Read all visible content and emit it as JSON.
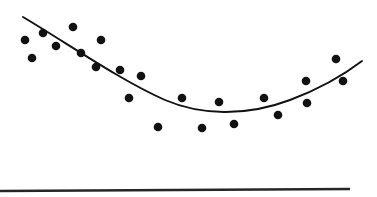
{
  "figure": {
    "width": 377,
    "height": 197,
    "background": "#ffffff",
    "title": "",
    "caption": ""
  },
  "style": {
    "point_color": "#111111",
    "point_radius": 4.3,
    "curve_color": "#111111",
    "curve_width": 1.9,
    "axis_color": "#262626",
    "axis_width": 2.4
  },
  "axis_line": {
    "name": "baseline-axis",
    "x1": 0,
    "y1": 191,
    "x2": 350,
    "y2": 189
  },
  "chart_data": {
    "type": "scatter",
    "title": "",
    "subtitle": "",
    "xlabel": "",
    "ylabel": "",
    "xlim": [
      0,
      377
    ],
    "ylim": [
      0,
      197
    ],
    "grid": false,
    "legend": null,
    "annotations": [],
    "tick_labels": {
      "x": [],
      "y": []
    },
    "series": [
      {
        "name": "observations",
        "type": "scatter",
        "marker": "filled-circle",
        "color": "#111111",
        "points": [
          {
            "x": 25,
            "y": 40
          },
          {
            "x": 32,
            "y": 58
          },
          {
            "x": 43,
            "y": 33
          },
          {
            "x": 56,
            "y": 46
          },
          {
            "x": 73,
            "y": 27
          },
          {
            "x": 81,
            "y": 53
          },
          {
            "x": 96,
            "y": 67
          },
          {
            "x": 101,
            "y": 40
          },
          {
            "x": 120,
            "y": 70
          },
          {
            "x": 129,
            "y": 98
          },
          {
            "x": 141,
            "y": 76
          },
          {
            "x": 158,
            "y": 127
          },
          {
            "x": 182,
            "y": 98
          },
          {
            "x": 202,
            "y": 128
          },
          {
            "x": 219,
            "y": 102
          },
          {
            "x": 234,
            "y": 124
          },
          {
            "x": 264,
            "y": 98
          },
          {
            "x": 278,
            "y": 115
          },
          {
            "x": 306,
            "y": 81
          },
          {
            "x": 307,
            "y": 103
          },
          {
            "x": 336,
            "y": 59
          },
          {
            "x": 343,
            "y": 81
          }
        ]
      }
    ],
    "fit_curve": {
      "name": "quadratic-trend-line",
      "type": "line",
      "color": "#111111",
      "path": "M 23 17 C 70 45, 120 80, 165 100 C 200 115, 245 117, 290 100 C 322 88, 345 74, 362 61",
      "x_start": 23,
      "y_start": 17,
      "x_end": 362,
      "y_end": 61,
      "vertex_x": 213,
      "vertex_y": 111
    }
  }
}
